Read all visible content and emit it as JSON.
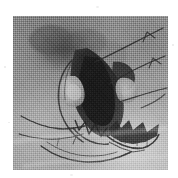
{
  "figure": {
    "kind": "scanned-grayscale-plate",
    "caption": "",
    "canvas": {
      "width": 178,
      "height": 178,
      "background": "#ffffff"
    },
    "plate": {
      "x": 13,
      "y": 16,
      "width": 155,
      "height": 154,
      "base_color": "#8e8e8e",
      "texture": "halftone-dither",
      "tone_range": {
        "darkest": "#1d1d1d",
        "background": "#949494",
        "lightest": "#c9c9c9"
      }
    },
    "subject": {
      "name": "specimen-silhouette",
      "description": "dark irregular central mass with radiating thin filaments",
      "ink_color": "#2a2a2a",
      "halo_color": "#5f5f5f"
    },
    "features": [
      {
        "name": "dark-diffuse-mass-upper-left",
        "cx": 0.34,
        "cy": 0.22,
        "tone": "#4a4a4a"
      },
      {
        "name": "dark-core-body",
        "cx": 0.44,
        "cy": 0.45,
        "tone": "#242424"
      },
      {
        "name": "light-lobe-inner",
        "cx": 0.36,
        "cy": 0.52,
        "tone": "#b0b0b0"
      },
      {
        "name": "light-lobe-right",
        "cx": 0.66,
        "cy": 0.5,
        "tone": "#bdbdbd"
      },
      {
        "name": "serrated-wing-lower-right",
        "cx": 0.66,
        "cy": 0.7,
        "tone": "#2d2d2d"
      },
      {
        "name": "bright-field-lower-right",
        "cx": 0.8,
        "cy": 0.86,
        "tone": "#c4c4c4"
      }
    ],
    "filaments": [
      {
        "name": "filament-upper-right-1",
        "from": [
          0.53,
          0.3
        ],
        "to": [
          0.97,
          0.09
        ]
      },
      {
        "name": "filament-upper-right-2",
        "from": [
          0.6,
          0.44
        ],
        "to": [
          0.99,
          0.27
        ]
      },
      {
        "name": "filament-right-mid",
        "from": [
          0.64,
          0.56
        ],
        "to": [
          1.0,
          0.47
        ]
      },
      {
        "name": "filament-lower-left-1",
        "from": [
          0.47,
          0.72
        ],
        "to": [
          0.02,
          0.64
        ]
      },
      {
        "name": "filament-lower-left-2",
        "from": [
          0.45,
          0.76
        ],
        "to": [
          0.03,
          0.76
        ]
      },
      {
        "name": "filament-lower-arc",
        "from": [
          0.2,
          0.84
        ],
        "to": [
          0.72,
          0.94
        ]
      }
    ],
    "annotations": {
      "labels": [],
      "scale_bar": null,
      "axis_ticks": []
    }
  }
}
